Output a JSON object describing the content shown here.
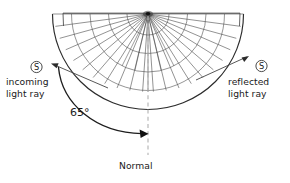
{
  "figure": {
    "type": "ray-reflection-protractor-diagram",
    "labels": {
      "incoming_marker": "S",
      "incoming_line1": "incoming",
      "incoming_line2": "light ray",
      "reflected_marker": "S",
      "reflected_line1": "reflected",
      "reflected_line2": "light ray",
      "angle": "65°",
      "normal": "Normal"
    },
    "colors": {
      "ink": "#1a1a1a",
      "line": "#3a3a3a",
      "grid": "#555555",
      "normal_dash": "#b3b3b3",
      "background": "#ffffff"
    },
    "geometry": {
      "center_x": 148,
      "center_y": 14,
      "radius": 96,
      "spoke_count": 24,
      "arc_count": 5,
      "angle_degrees": 65
    }
  }
}
